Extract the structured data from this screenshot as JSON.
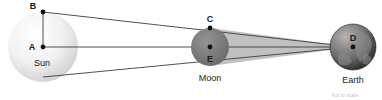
{
  "diagram": {
    "background": "#ffffff",
    "bodies": [
      {
        "id": "sun",
        "label": "Sun",
        "label_x": 42,
        "label_y": 63,
        "cx": 43,
        "cy": 47,
        "r": 35,
        "fill_center": "#ffffff",
        "fill_edge": "#d2d2d2",
        "points": [
          {
            "id": "B",
            "label": "B",
            "x": 43,
            "y": 12,
            "label_x": 33,
            "label_y": 9
          },
          {
            "id": "A",
            "label": "A",
            "x": 43,
            "y": 47,
            "label_x": 32,
            "label_y": 50
          }
        ]
      },
      {
        "id": "moon",
        "label": "Moon",
        "label_x": 210,
        "label_y": 81,
        "cx": 210,
        "cy": 47,
        "r": 19,
        "fill_center": "#8c8c8c",
        "fill_edge": "#6e6e6e",
        "points": [
          {
            "id": "C",
            "label": "C",
            "x": 210,
            "y": 28,
            "label_x": 210,
            "label_y": 22
          },
          {
            "id": "E",
            "label": "E",
            "x": 210,
            "y": 47,
            "label_x": 210,
            "label_y": 62
          }
        ]
      },
      {
        "id": "earth",
        "label": "Earth",
        "label_x": 353,
        "label_y": 83,
        "cx": 353,
        "cy": 47,
        "r": 23,
        "fill_center": "#9a9a9a",
        "fill_edge": "#2b2b2b",
        "points": [
          {
            "id": "D",
            "label": "D",
            "x": 353,
            "y": 47,
            "label_x": 353,
            "label_y": 40
          }
        ]
      }
    ],
    "segments": [
      {
        "id": "radius-AB",
        "from": "A",
        "to": "B",
        "x1": 43,
        "y1": 47,
        "x2": 43,
        "y2": 12
      },
      {
        "id": "radius-CE",
        "from": "C",
        "to": "E",
        "x1": 210,
        "y1": 28,
        "x2": 210,
        "y2": 47
      },
      {
        "id": "axis-A-to-D",
        "from": "A",
        "to": "D",
        "x1": 43,
        "y1": 47,
        "x2": 353,
        "y2": 47
      },
      {
        "id": "tangent-B-through-C-to-D",
        "from": "B",
        "to": "D",
        "x1": 43,
        "y1": 12,
        "x2": 353,
        "y2": 47
      },
      {
        "id": "tangent-sun-lower-to-D",
        "from": "sun-lower-limb",
        "to": "D",
        "x1": 43,
        "y1": 77,
        "x2": 353,
        "y2": 47
      }
    ],
    "umbra": {
      "id": "umbra-shadow-cone",
      "fill": "#a8a8a8",
      "opacity": 0.75,
      "points": "210,28 353,47 210,66"
    },
    "stroke_color": "#3c3c3c",
    "point_color": "#111111",
    "footnote": "Not to scale"
  }
}
